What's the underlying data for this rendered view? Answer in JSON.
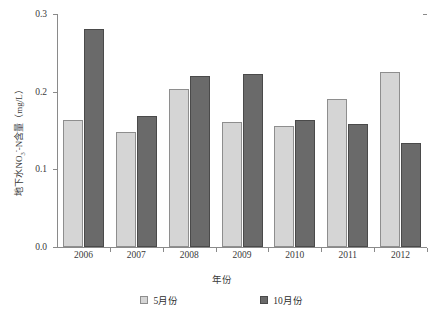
{
  "chart_data": {
    "type": "bar",
    "title": "",
    "xlabel": "年份",
    "ylabel": "地下水NO3--N含量（mg/L）",
    "categories": [
      "2006",
      "2007",
      "2008",
      "2009",
      "2010",
      "2011",
      "2012"
    ],
    "series": [
      {
        "name": "5月份",
        "color": "#d5d5d5",
        "values": [
          0.164,
          0.148,
          0.204,
          0.161,
          0.156,
          0.191,
          0.225
        ]
      },
      {
        "name": "10月份",
        "color": "#6a6a6a",
        "values": [
          0.281,
          0.169,
          0.22,
          0.223,
          0.164,
          0.159,
          0.134
        ]
      }
    ],
    "ylim": [
      0.0,
      0.3
    ],
    "yticks": [
      "0.0",
      "0.1",
      "0.2",
      "0.3"
    ],
    "ytick_values": [
      0.0,
      0.1,
      0.2,
      0.3
    ],
    "grid": false,
    "legend_position": "bottom"
  },
  "axis": {
    "y_label_parts": {
      "prefix": "地下水NO",
      "sub": "3",
      "sup": "-",
      "suffix": "-N含量（mg/L）"
    }
  },
  "legend": {
    "items": [
      {
        "label": "5月份"
      },
      {
        "label": "10月份"
      }
    ]
  }
}
